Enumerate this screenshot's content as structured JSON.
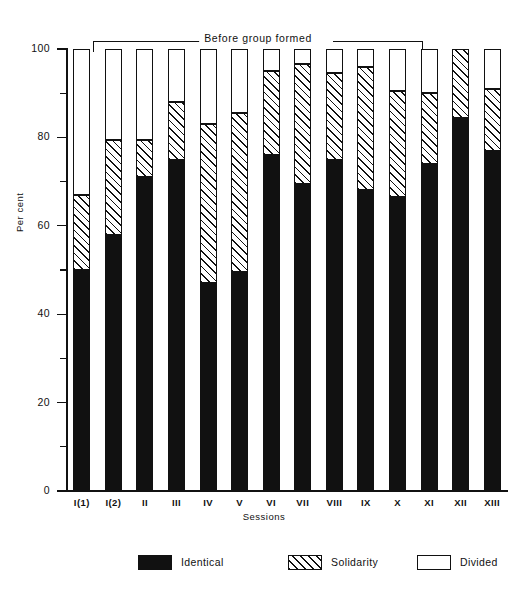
{
  "chart_data": {
    "type": "bar",
    "subtype": "stacked-100-percent",
    "title": "",
    "annotation": "Before group formed",
    "annotation_spans_categories": [
      "I(1)",
      "I(2)",
      "II",
      "III",
      "IV",
      "V",
      "VI",
      "VII",
      "VIII",
      "IX",
      "X"
    ],
    "xlabel": "Sessions",
    "ylabel": "Per cent",
    "ylim": [
      0,
      100
    ],
    "ymajor_ticks": [
      0,
      20,
      40,
      60,
      80,
      100
    ],
    "yminor_ticks": [
      10,
      30,
      50,
      70,
      90
    ],
    "ytick_labels": [
      "0",
      "20",
      "40",
      "60",
      "80",
      "100"
    ],
    "grid": false,
    "legend_position": "bottom",
    "categories": [
      "I(1)",
      "I(2)",
      "II",
      "III",
      "IV",
      "V",
      "VI",
      "VII",
      "VIII",
      "IX",
      "X",
      "XI",
      "XII",
      "XIII"
    ],
    "series": [
      {
        "name": "Identical",
        "fill": "solid-black",
        "color": "#111111",
        "values": [
          50,
          58,
          71,
          75,
          47,
          49.5,
          76,
          69.5,
          75,
          68,
          66.5,
          74,
          84.5,
          77
        ]
      },
      {
        "name": "Solidarity",
        "fill": "diagonal-hatch",
        "color": "#ffffff",
        "values": [
          17,
          21.5,
          8.5,
          13,
          36,
          36,
          19,
          27,
          19.5,
          28,
          24,
          16,
          15.5,
          14
        ]
      },
      {
        "name": "Divided",
        "fill": "white",
        "color": "#ffffff",
        "values": [
          33,
          20.5,
          20.5,
          12,
          17,
          14.5,
          5,
          3.5,
          5.5,
          4,
          9.5,
          10,
          0,
          9
        ]
      }
    ]
  },
  "legend": {
    "items": [
      {
        "label": "Identical"
      },
      {
        "label": "Solidarity"
      },
      {
        "label": "Divided"
      }
    ]
  }
}
